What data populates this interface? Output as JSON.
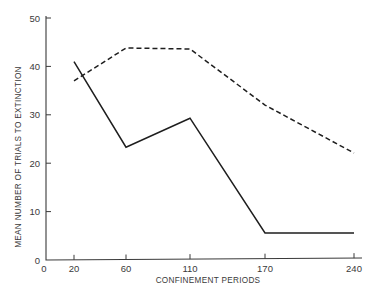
{
  "chart_data": {
    "type": "line",
    "title": "",
    "xlabel": "CONFINEMENT PERIODS",
    "ylabel": "MEAN NUMBER OF TRIALS TO EXTINCTION",
    "x": [
      20,
      60,
      110,
      170,
      240
    ],
    "x_tick_labels": [
      "0",
      "20",
      "60",
      "110",
      "170",
      "240"
    ],
    "y_tick_labels": [
      "0",
      "10",
      "20",
      "30",
      "40",
      "50"
    ],
    "ylim": [
      0,
      50
    ],
    "grid": false,
    "legend": null,
    "series": [
      {
        "name": "solid",
        "style": "solid",
        "values": [
          41,
          23.3,
          29.3,
          5.6,
          5.6
        ]
      },
      {
        "name": "dashed",
        "style": "dashed",
        "values": [
          37,
          43.8,
          43.6,
          32,
          22.1
        ]
      }
    ]
  },
  "layout": {
    "plot": {
      "x0": 46,
      "y0": 260,
      "y50": 18,
      "x_end": 362
    },
    "x_pixel": {
      "0": 46,
      "20": 74,
      "60": 126,
      "110": 190,
      "170": 265,
      "240": 354
    }
  }
}
